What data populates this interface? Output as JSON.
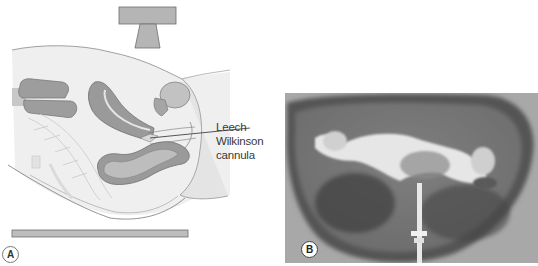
{
  "figure": {
    "panels": [
      {
        "id": "A",
        "type": "anatomical-illustration",
        "label": "A",
        "callout": {
          "line1": "Leech Wilkinson",
          "line2": "cannula"
        },
        "elements": [
          "x-ray-tube",
          "pelvis-sagittal-section",
          "x-ray-table"
        ]
      },
      {
        "id": "B",
        "type": "radiograph",
        "label": "B"
      }
    ],
    "colors": {
      "organ_fill": "#9a9a9a",
      "organ_stroke": "#6e6e6e",
      "body_fill": "#ececec",
      "tube_fill": "#b5b5b5",
      "table_fill": "#bdbdbd",
      "xray_dark": "#3e3e3e",
      "xray_light": "#e6e6e6"
    }
  }
}
